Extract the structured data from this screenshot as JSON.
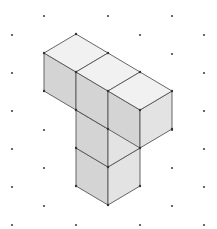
{
  "diagram": {
    "type": "isometric-cube-drawing",
    "grid": {
      "kind": "isometric-dot-grid",
      "dot_color": "#444444",
      "dots": [
        [
          44,
          16
        ],
        [
          108,
          16
        ],
        [
          172,
          16
        ],
        [
          12,
          35
        ],
        [
          140,
          35
        ],
        [
          204,
          35
        ],
        [
          172,
          54
        ],
        [
          12,
          73
        ],
        [
          204,
          73
        ],
        [
          12,
          111
        ],
        [
          204,
          111
        ],
        [
          44,
          130
        ],
        [
          172,
          130
        ],
        [
          12,
          149
        ],
        [
          204,
          149
        ],
        [
          44,
          168
        ],
        [
          172,
          168
        ],
        [
          12,
          187
        ],
        [
          204,
          187
        ],
        [
          44,
          206
        ],
        [
          172,
          206
        ],
        [
          12,
          225
        ],
        [
          76,
          225
        ],
        [
          140,
          225
        ],
        [
          204,
          225
        ]
      ]
    },
    "colors": {
      "top_face": "#f1f1f1",
      "left_face": "#d4d4d4",
      "right_face": "#e3e3e3",
      "edge": "#555555",
      "vertex": "#333333"
    },
    "cube_count": 5
  }
}
